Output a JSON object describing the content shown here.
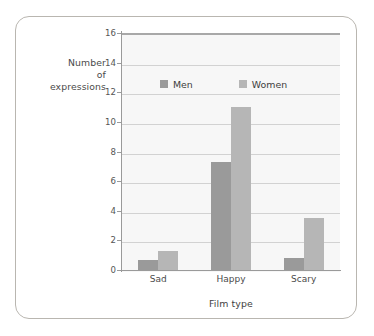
{
  "chart_data": {
    "type": "bar",
    "title": "",
    "categories": [
      "Sad",
      "Happy",
      "Scary"
    ],
    "series": [
      {
        "name": "Men",
        "values": [
          0.7,
          7.3,
          0.8
        ],
        "color": "#9a9a9a"
      },
      {
        "name": "Women",
        "values": [
          1.3,
          11.0,
          3.5
        ],
        "color": "#b6b6b6"
      }
    ],
    "xlabel": "Film type",
    "ylabel": "Number of expressions",
    "ylabel_lines": [
      "Number",
      "of",
      "expressions"
    ],
    "ylim": [
      0,
      16
    ],
    "ytick_labels": [
      "0",
      "2",
      "4",
      "6",
      "8",
      "10",
      "12",
      "14",
      "16"
    ],
    "ytick_values": [
      0,
      2,
      4,
      6,
      8,
      10,
      12,
      14,
      16
    ],
    "grid": "horizontal",
    "legend_position": "upper-center-inside",
    "legend_entries": [
      "Men",
      "Women"
    ],
    "plot_background": "#f7f7f7",
    "frame_border_color": "#b9b6b0",
    "axis_color": "#9a9a9a",
    "gridline_color": "#d2d2d2"
  }
}
